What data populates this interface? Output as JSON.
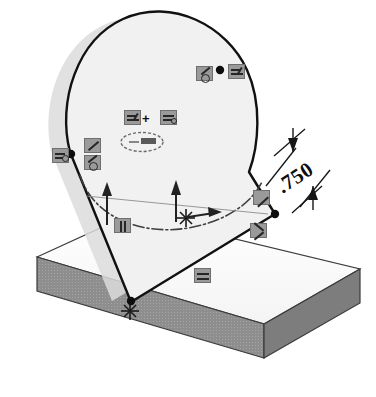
{
  "scene": {
    "title": "CAD sketch on angled plane over rectangular slab",
    "background_color": "#ffffff"
  },
  "dimension": {
    "value": ".750",
    "rotation_deg": -33,
    "witness_lines": 2,
    "arrow_style": "inward-tick-arrows"
  },
  "colors": {
    "sketch_line": "#111111",
    "slab_top": "#fbfbfb",
    "slab_front": "#8e8e8e",
    "slab_side": "#7e7e7e",
    "profile_fill": "#f1f1f1",
    "shadow": "#d8d8d8",
    "badge_fill": "#9a9a9a",
    "badge_border": "#6f6f6f",
    "centerline": "#444444",
    "plane_outline": "#9b9b9b"
  },
  "geometry": {
    "slab": {
      "shape": "isometric-rectangular-plate",
      "top_face": "light",
      "visible_side_faces": 2
    },
    "profile": {
      "shape": "teardrop-slot",
      "tangent_lines": 2,
      "arc_count": 2,
      "has_drop_shadow": true
    },
    "sketch_plane": {
      "shape": "parallelogram",
      "style": "thin-gray-outline"
    },
    "construction_arc": {
      "style": "chain-dash-dot"
    }
  },
  "markers": {
    "origin": {
      "name": "sketch-origin",
      "glyph": "asterisk-star",
      "count": 2
    },
    "vertices": [
      {
        "name": "top-right-vertex"
      },
      {
        "name": "left-tangent-vertex"
      },
      {
        "name": "bottom-vertex"
      },
      {
        "name": "right-vertex"
      }
    ],
    "arrows": [
      {
        "name": "plane-normal-arrow-left",
        "direction": "up"
      },
      {
        "name": "plane-normal-arrow-center",
        "direction": "up"
      },
      {
        "name": "plane-axis-arrow-right",
        "direction": "right"
      }
    ]
  },
  "relation_badges": [
    {
      "id": "b1",
      "name": "relation-badge-tangent-top",
      "icon": "tangent-icon",
      "x": 196,
      "y": 66,
      "size": "md"
    },
    {
      "id": "b2",
      "name": "relation-badge-coincident-top",
      "icon": "coincident-icon",
      "x": 228,
      "y": 64,
      "size": "md"
    },
    {
      "id": "b3",
      "name": "relation-badge-equal-center-left",
      "icon": "equal-icon",
      "x": 124,
      "y": 110,
      "size": "md"
    },
    {
      "id": "b4",
      "name": "relation-badge-equal-center-right",
      "icon": "equal-icon",
      "x": 160,
      "y": 110,
      "size": "md"
    },
    {
      "id": "b5",
      "name": "relation-badge-coincident-left",
      "icon": "coincident-icon",
      "x": 52,
      "y": 148,
      "size": "md"
    },
    {
      "id": "b6",
      "name": "relation-badge-tangent-left-upper",
      "icon": "tangent-icon",
      "x": 84,
      "y": 138,
      "size": "md"
    },
    {
      "id": "b7",
      "name": "relation-badge-tangent-left-lower",
      "icon": "tangent-icon",
      "x": 84,
      "y": 155,
      "size": "md"
    },
    {
      "id": "b8",
      "name": "relation-badge-horizontal-bottom",
      "icon": "horizontal-icon",
      "x": 114,
      "y": 218,
      "size": "md"
    },
    {
      "id": "b9",
      "name": "relation-badge-tangent-right-top",
      "icon": "tangent-icon",
      "x": 253,
      "y": 190,
      "size": "md"
    },
    {
      "id": "b10",
      "name": "relation-badge-vertex-right-lower",
      "icon": "coincident-icon",
      "x": 250,
      "y": 223,
      "size": "md"
    },
    {
      "id": "b11",
      "name": "relation-badge-parallel-base",
      "icon": "parallel-icon",
      "x": 194,
      "y": 268,
      "size": "md"
    }
  ],
  "symbols": {
    "plus_label": "+",
    "ellipse_marker": {
      "name": "construction-ellipse-marker",
      "shape": "ellipse-outline-with-dashed-core"
    }
  }
}
